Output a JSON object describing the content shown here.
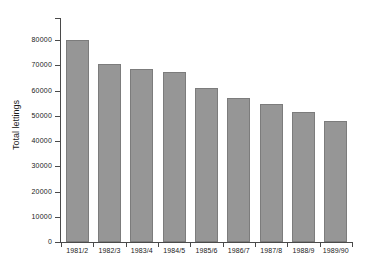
{
  "chart_data": {
    "type": "bar",
    "title": "",
    "xlabel": "",
    "ylabel": "Total lettings",
    "categories": [
      "1981/2",
      "1982/3",
      "1983/4",
      "1984/5",
      "1985/6",
      "1986/7",
      "1987/8",
      "1988/9",
      "1989/90"
    ],
    "values": [
      80000,
      70500,
      68500,
      67500,
      61000,
      57000,
      54800,
      51500,
      47800
    ],
    "ylim": [
      0,
      84000
    ],
    "yticks": [
      0,
      10000,
      20000,
      30000,
      40000,
      50000,
      60000,
      70000,
      80000
    ],
    "ytick_labels": [
      "0",
      "10000",
      "20000",
      "30000",
      "40000",
      "50000",
      "60000",
      "70000",
      "80000"
    ],
    "grid": false,
    "legend": "none",
    "bar_color": "#969696",
    "bar_edge_color": "#7c7c7c",
    "axis_color": "#4a4a4a",
    "background": "#ffffff"
  }
}
